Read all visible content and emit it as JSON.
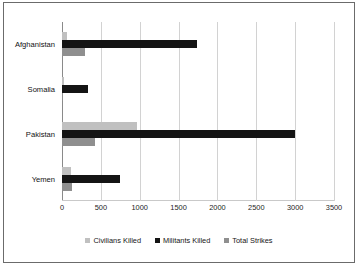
{
  "chart_data": {
    "type": "bar",
    "orientation": "horizontal",
    "title": "",
    "xlabel": "",
    "ylabel": "",
    "xlim": [
      0,
      3500
    ],
    "xticks": [
      0,
      500,
      1000,
      1500,
      2000,
      2500,
      3000,
      3500
    ],
    "xtick_labels": [
      "0",
      "500",
      "1000",
      "1500",
      "2000",
      "2500",
      "3000",
      "3500"
    ],
    "grid": true,
    "legend_position": "bottom",
    "categories": [
      "Afghanistan",
      "Somalia",
      "Pakistan",
      "Yemen"
    ],
    "series": [
      {
        "name": "Civilians Killed",
        "color": "#c0c0c0",
        "values": [
          60,
          25,
          960,
          120
        ]
      },
      {
        "name": "Militants Killed",
        "color": "#141414",
        "values": [
          1735,
          340,
          3000,
          740
        ]
      },
      {
        "name": "Total Strikes",
        "color": "#8f8f8f",
        "values": [
          295,
          10,
          430,
          125
        ]
      }
    ]
  },
  "legend": {
    "items": [
      {
        "label": "Civilians Killed",
        "swatch": "civ"
      },
      {
        "label": "Militants Killed",
        "swatch": "mil"
      },
      {
        "label": "Total Strikes",
        "swatch": "tot"
      }
    ]
  }
}
